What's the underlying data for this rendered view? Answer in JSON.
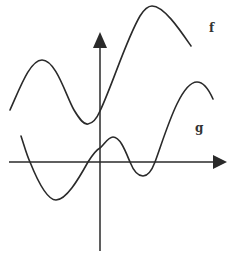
{
  "diagram": {
    "title": "",
    "axes": {
      "x_axis": {
        "arrow": "right"
      },
      "y_axis": {
        "arrow": "up"
      }
    },
    "curves": [
      {
        "id": "f",
        "label": "f",
        "description": "wavy curve mostly above x-axis, local max left of y-axis, local min just left of y-axis, large max right of y-axis"
      },
      {
        "id": "g",
        "label": "g",
        "description": "wavy curve crossing x-axis several times, min left of y-axis, small max right of y-axis, min then rising max at right"
      }
    ],
    "colors": {
      "ink": "#2a2a2a",
      "background": "#ffffff"
    }
  }
}
